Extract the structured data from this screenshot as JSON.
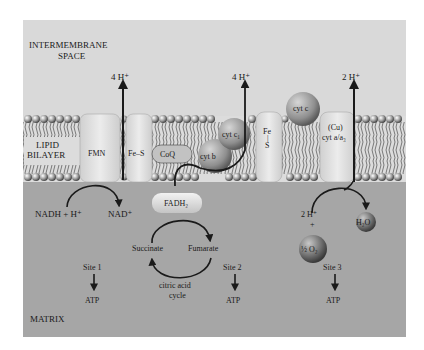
{
  "regions": {
    "intermembrane_line1": "INTERMEMBRANE",
    "intermembrane_line2": "SPACE",
    "lipid_line1": "LIPID",
    "lipid_line2": "BILAYER",
    "matrix": "MATRIX"
  },
  "complexes": {
    "fmn": "FMN",
    "fes_1": "Fe–S",
    "coq": "CoQ",
    "cyt_b": "cyt b",
    "cyt_c1": "cyt c₁",
    "fes_2_line1": "Fe",
    "fes_2_line2": "|",
    "fes_2_line3": "S",
    "cyt_c": "cyt c",
    "cu_line1": "(Cu)",
    "cu_line2": "cyt a/a₃",
    "fadh2": "FADH₂"
  },
  "protons": {
    "site1": "4 H⁺",
    "site2": "4 H⁺",
    "site3": "2 H⁺"
  },
  "reactions": {
    "nadh": "NADH + H⁺",
    "nad": "NAD⁺",
    "succinate": "Succinate",
    "fumarate": "Fumarate",
    "cycle_line1": "citric acid",
    "cycle_line2": "cycle",
    "h2_in": "2 H⁺",
    "plus": "+",
    "half_o2": "½ O₂",
    "h2o": "H₂O"
  },
  "sites": [
    {
      "label": "Site 1",
      "product": "ATP"
    },
    {
      "label": "Site 2",
      "product": "ATP"
    },
    {
      "label": "Site 3",
      "product": "ATP"
    }
  ],
  "colors": {
    "intermembrane_bg": "#d9d9d9",
    "matrix_bg": "#a6a6a6",
    "protein": "#e4e4e4",
    "sphere_mid": "#9a9a9a",
    "ink": "#1a1a1a"
  }
}
